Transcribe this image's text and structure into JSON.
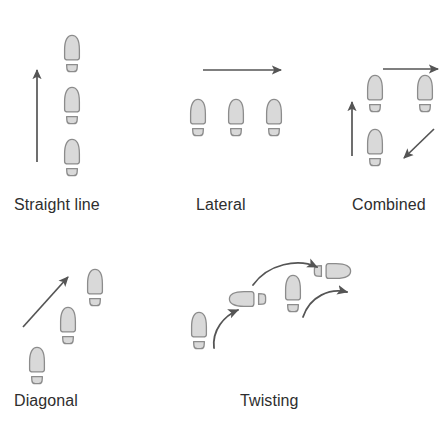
{
  "figure": {
    "title": "",
    "background_color": "#ffffff",
    "footprint_fill": "#d9d9d9",
    "footprint_stroke": "#8c8c8c",
    "arrow_color": "#555555",
    "label_color": "#2e2e2e"
  },
  "panels": [
    {
      "id": "straight-line",
      "label": "Straight line",
      "label_x": 14,
      "label_y": 196,
      "icon_names": [
        "footprint-icon",
        "up-arrow-icon"
      ],
      "footprints": [
        {
          "x": 72,
          "y": 48,
          "rotation": 0
        },
        {
          "x": 72,
          "y": 100,
          "rotation": 0
        },
        {
          "x": 72,
          "y": 152,
          "rotation": 0
        }
      ],
      "arrows": [
        {
          "type": "straight",
          "x1": 37,
          "y1": 162,
          "x2": 37,
          "y2": 68,
          "label": "up-arrow-icon"
        }
      ]
    },
    {
      "id": "lateral",
      "label": "Lateral",
      "label_x": 196,
      "label_y": 196,
      "icon_names": [
        "footprint-icon",
        "right-arrow-icon"
      ],
      "footprints": [
        {
          "x": 198,
          "y": 112,
          "rotation": 0
        },
        {
          "x": 236,
          "y": 112,
          "rotation": 0
        },
        {
          "x": 274,
          "y": 112,
          "rotation": 0
        }
      ],
      "arrows": [
        {
          "type": "straight",
          "x1": 203,
          "y1": 70,
          "x2": 283,
          "y2": 70,
          "label": "right-arrow-icon"
        }
      ]
    },
    {
      "id": "combined",
      "label": "Combined",
      "label_x": 352,
      "label_y": 196,
      "icon_names": [
        "footprint-icon",
        "up-arrow-icon",
        "right-arrow-icon",
        "diagonal-arrow-icon"
      ],
      "footprints": [
        {
          "x": 375,
          "y": 88,
          "rotation": 0
        },
        {
          "x": 425,
          "y": 88,
          "rotation": 0
        },
        {
          "x": 375,
          "y": 142,
          "rotation": 0
        }
      ],
      "arrows": [
        {
          "type": "straight",
          "x1": 352,
          "y1": 156,
          "x2": 352,
          "y2": 100,
          "label": "up-arrow-icon"
        },
        {
          "type": "straight",
          "x1": 383,
          "y1": 70,
          "x2": 440,
          "y2": 70,
          "label": "right-arrow-icon"
        },
        {
          "type": "straight",
          "x1": 434,
          "y1": 130,
          "x2": 402,
          "y2": 160,
          "label": "diagonal-arrow-icon"
        }
      ]
    },
    {
      "id": "diagonal",
      "label": "Diagonal",
      "label_x": 14,
      "label_y": 392,
      "icon_names": [
        "footprint-icon",
        "diagonal-arrow-icon"
      ],
      "footprints": [
        {
          "x": 95,
          "y": 282,
          "rotation": 0
        },
        {
          "x": 68,
          "y": 320,
          "rotation": 0
        },
        {
          "x": 37,
          "y": 360,
          "rotation": 0
        }
      ],
      "arrows": [
        {
          "type": "straight",
          "x1": 24,
          "y1": 325,
          "x2": 66,
          "y2": 278,
          "label": "diagonal-arrow-icon"
        }
      ]
    },
    {
      "id": "twisting",
      "label": "Twisting",
      "label_x": 240,
      "label_y": 392,
      "icon_names": [
        "footprint-icon",
        "rotated-footprint-icon",
        "curved-arrow-icon"
      ],
      "footprints": [
        {
          "x": 199,
          "y": 325,
          "rotation": 0
        },
        {
          "x": 242,
          "y": 299,
          "rotation": -90
        },
        {
          "x": 293,
          "y": 288,
          "rotation": 0
        },
        {
          "x": 338,
          "y": 271,
          "rotation": 90
        }
      ],
      "arrows": [
        {
          "type": "curved",
          "label": "curved-arrow-icon",
          "path": "M 220 345 C 216 322, 228 312, 240 308"
        },
        {
          "type": "curved",
          "label": "curved-arrow-icon",
          "path": "M 255 283 C 272 262, 300 259, 318 267"
        },
        {
          "type": "curved",
          "label": "curved-arrow-icon",
          "path": "M 306 315 C 312 294, 330 288, 348 291"
        }
      ]
    }
  ]
}
